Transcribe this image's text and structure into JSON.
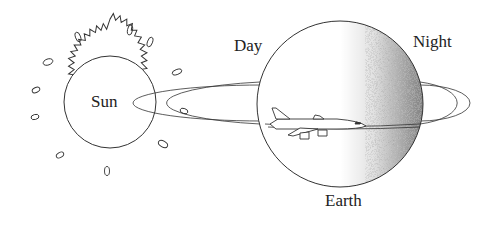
{
  "diagram": {
    "sun": {
      "label": "Sun"
    },
    "earth": {
      "label": "Earth",
      "day_label": "Day",
      "night_label": "Night"
    },
    "airplane": {
      "name": "airplane"
    },
    "colors": {
      "line": "#333333",
      "shade": "#555555",
      "background": "#ffffff"
    }
  }
}
